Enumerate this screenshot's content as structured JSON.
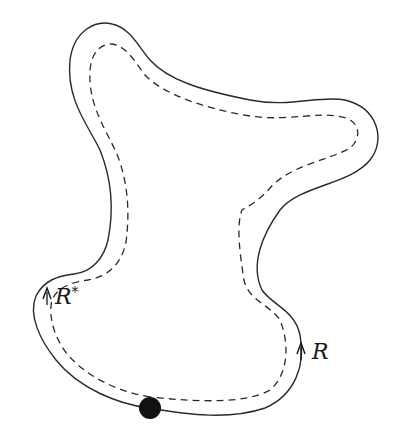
{
  "diagram": {
    "colors": {
      "background": "#ffffff",
      "stroke": "#2a2a2a",
      "marked_point": "#111111"
    },
    "curves": {
      "outer_boundary": {
        "style": "solid"
      },
      "inner_curve": {
        "style": "dashed"
      }
    },
    "labels": {
      "r_star": {
        "base": "R",
        "sup": "*"
      },
      "r": {
        "base": "R"
      }
    },
    "marked_point": {
      "shape": "filled-circle"
    }
  }
}
